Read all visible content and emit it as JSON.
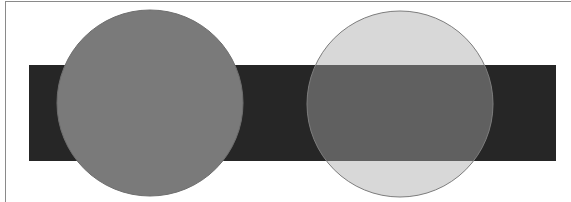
{
  "diagram": {
    "rectangle": {
      "x": 29,
      "y": 65,
      "width": 527,
      "height": 96,
      "color": "#262626"
    },
    "circles": [
      {
        "name": "opaque-circle",
        "cx": 150,
        "cy": 103,
        "r": 93,
        "fill": "#7a7a7a",
        "opacity": 1,
        "stroke": "#6e6e6e"
      },
      {
        "name": "transparent-circle",
        "cx": 400,
        "cy": 104,
        "r": 93,
        "fill": "#a9a9a9",
        "opacity": 0.45,
        "stroke": "#7d7d7d"
      }
    ],
    "frame_color": "#8a8a8a",
    "background": "#ffffff"
  }
}
